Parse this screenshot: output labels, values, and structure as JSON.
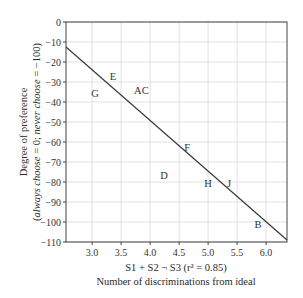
{
  "chart_data": {
    "type": "scatter",
    "title": "",
    "xlabel_line1": "S1 + S2 ¬ S3 (r² = 0.85)",
    "xlabel_line2": "Number of discriminations from ideal",
    "ylabel_line1": "Degree of preference",
    "ylabel_line2_parts": [
      "(",
      "always choose",
      " = 0; ",
      "never choose",
      " = −100)"
    ],
    "xlim": [
      2.55,
      6.36
    ],
    "ylim": [
      -110,
      0
    ],
    "x_ticks": [
      3.0,
      3.5,
      4.0,
      4.5,
      5.0,
      5.5,
      6.0
    ],
    "x_tick_labels": [
      "3.0",
      "3.5",
      "4.0",
      "4.5",
      "5.0",
      "5.5",
      "6.0"
    ],
    "y_ticks": [
      0,
      -10,
      -20,
      -30,
      -40,
      -50,
      -60,
      -70,
      -80,
      -90,
      -100,
      -110
    ],
    "y_tick_labels": [
      "0",
      "−10",
      "−20",
      "−30",
      "−40",
      "−50",
      "−60",
      "−70",
      "−80",
      "−90",
      "−100",
      "−110"
    ],
    "grid": true,
    "legend": null,
    "points": [
      {
        "label": "E",
        "x": 3.36,
        "y": -27
      },
      {
        "label": "G",
        "x": 3.05,
        "y": -35.5
      },
      {
        "label": "AC",
        "x": 3.85,
        "y": -34
      },
      {
        "label": "F",
        "x": 4.64,
        "y": -62.5
      },
      {
        "label": "D",
        "x": 4.24,
        "y": -76.5
      },
      {
        "label": "H",
        "x": 5.0,
        "y": -80.5
      },
      {
        "label": "J",
        "x": 5.36,
        "y": -80.5
      },
      {
        "label": "B",
        "x": 5.86,
        "y": -101
      }
    ],
    "regression_line": {
      "x": [
        2.55,
        6.36
      ],
      "y": [
        -12.5,
        -109
      ],
      "r2": 0.85
    },
    "colors": {
      "line": "#3a3a3a",
      "grid": "#d9d9d9",
      "frame": "#444444",
      "text": "#2a2a2a"
    }
  }
}
